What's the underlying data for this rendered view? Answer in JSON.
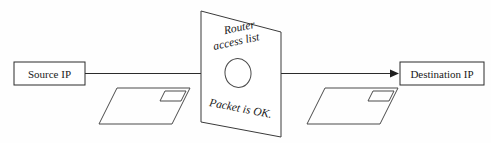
{
  "diagram": {
    "type": "network-flow-diagram",
    "background_color": "#fefefe",
    "line_color": "#2b2b2b",
    "shape_color": "#4a4a4a",
    "text_color": "#1a1a1a",
    "nodes": {
      "source": {
        "label": "Source IP",
        "shape": "rectangle"
      },
      "destination": {
        "label": "Destination IP",
        "shape": "rectangle"
      },
      "router_panel": {
        "heading_line_1": "Router",
        "heading_line_2": "access list",
        "verdict": "Packet is OK.",
        "shape": "tilted-panel",
        "aperture": "ellipse"
      }
    },
    "packets": [
      {
        "name": "packet-left",
        "shape": "envelope"
      },
      {
        "name": "packet-right",
        "shape": "envelope"
      }
    ],
    "connector": {
      "direction": "left-to-right",
      "arrowhead": "solid-triangle"
    }
  }
}
